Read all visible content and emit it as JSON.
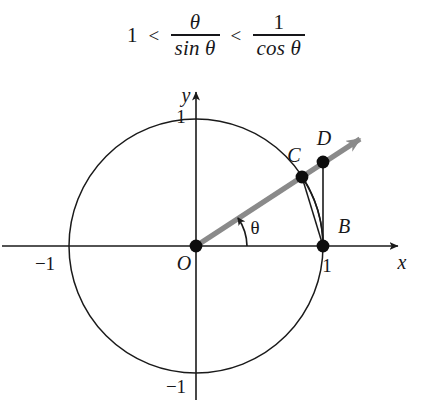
{
  "formula": {
    "left_term": "1",
    "relation_1": "<",
    "middle_numerator": "θ",
    "middle_denominator": "sin θ",
    "relation_2": "<",
    "right_numerator": "1",
    "right_denominator": "cos θ",
    "plain_text": "1 < θ / sin θ < 1 / cos θ"
  },
  "diagram": {
    "axes": {
      "x_label": "x",
      "y_label": "y",
      "x_tick_negative": "−1",
      "x_tick_positive": "1",
      "y_tick_positive": "1",
      "y_tick_negative": "−1"
    },
    "angle_label": "θ",
    "points": [
      {
        "id": "O",
        "label": "O",
        "x": 0,
        "y": 0,
        "description": "origin"
      },
      {
        "id": "B",
        "label": "B",
        "x": 1,
        "y": 0,
        "description": "point on circle at angle 0"
      },
      {
        "id": "C",
        "label": "C",
        "x": 0.835,
        "y": 0.545,
        "description": "point on circle at angle theta"
      },
      {
        "id": "D",
        "label": "D",
        "x": 1,
        "y": 0.655,
        "description": "intersection of ray with vertical tangent at B"
      }
    ],
    "circle": {
      "center_x": 0,
      "center_y": 0,
      "radius": 1
    },
    "theta_degrees": 33,
    "colors": {
      "ray": "#878787",
      "stroke": "#1a1a1a",
      "background": "#ffffff"
    }
  }
}
